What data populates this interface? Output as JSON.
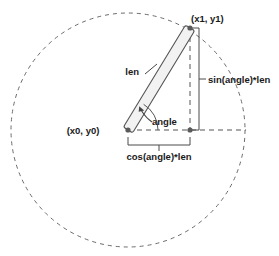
{
  "diagram": {
    "colors": {
      "stroke": "#4a4a4a",
      "dashed": "#6b6b6b",
      "bar_fill": "#f2f2f2",
      "bar_stroke": "#555555",
      "point": "#5a5a5a",
      "text": "#1a1a1a",
      "background": "#ffffff"
    },
    "labels": {
      "origin": "(x0, y0)",
      "endpoint": "(x1, y1)",
      "length": "len",
      "angle": "angle",
      "horizontal_component": "cos(angle)*len",
      "vertical_component": "sin(angle)*len"
    },
    "geometry": {
      "circle_center": [
        128,
        130
      ],
      "circle_radius": 117,
      "pivot_point": [
        128,
        130
      ],
      "tip_point": [
        190,
        28
      ],
      "corner_point": [
        190,
        130
      ],
      "arm_half_width": 5,
      "horizontal_dash_end_x": 246,
      "angle_arc_radius": 30
    }
  }
}
